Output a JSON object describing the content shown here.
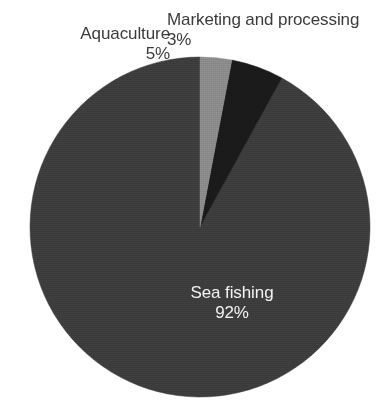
{
  "chart_data": {
    "type": "pie",
    "title": "",
    "subtitle": "",
    "xlabel": "",
    "ylabel": "",
    "legend_position": "none",
    "grid": false,
    "labels_shown_on_slices": true,
    "unit": "%",
    "categories": [
      "Sea fishing",
      "Aquaculture",
      "Marketing and processing"
    ],
    "values": [
      92,
      5,
      3
    ],
    "slices": [
      {
        "name": "Sea fishing",
        "label": "Sea fishing",
        "value": 92,
        "value_label": "92%",
        "color": "#3c3c3c",
        "label_placement": "inside",
        "label_color": "#f2f2f2"
      },
      {
        "name": "Aquaculture",
        "label": "Aquaculture",
        "value": 5,
        "value_label": "5%",
        "color": "#1a1a1a",
        "label_placement": "outside-top-left",
        "label_color": "#3a3a3a"
      },
      {
        "name": "Marketing and processing",
        "label": "Marketing and processing",
        "value": 3,
        "value_label": "3%",
        "color": "#8a8a8a",
        "label_placement": "outside-top-right",
        "label_color": "#3a3a3a"
      }
    ],
    "start_angle_deg": 0,
    "direction": "counterclockwise",
    "background_color": "#ffffff"
  },
  "geometry": {
    "center_x": 200,
    "center_y": 227,
    "radius": 170
  }
}
